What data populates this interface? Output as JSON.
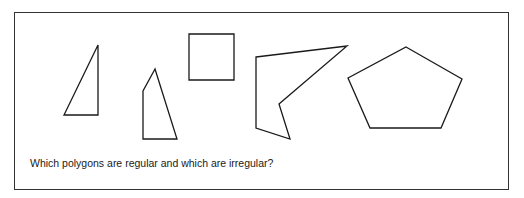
{
  "question": "Which polygons are regular and which are irregular?",
  "stroke_color": "#1a1a1a",
  "polygons": [
    {
      "name": "right-triangle",
      "points": "98,45 98,115 64,115"
    },
    {
      "name": "irregular-quadrilateral",
      "points": "155,69 143,91 143,139 177,139"
    },
    {
      "name": "square",
      "points": "189,34 234,34 234,80 189,80"
    },
    {
      "name": "irregular-pentagon",
      "points": "256,57 347,46 279,104 290,139 256,128"
    },
    {
      "name": "regular-pentagon",
      "points": "406,47 462,79 441,128 370,128 348,78"
    }
  ]
}
